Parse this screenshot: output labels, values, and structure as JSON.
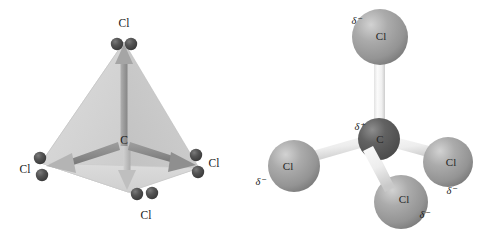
{
  "figure": {
    "background_color": "#ffffff",
    "panels": [
      {
        "id": "tetrahedral-geometry",
        "name": "tetrahedron-bond-dipole-diagram",
        "central_atom": {
          "label": "C",
          "symbol": "C"
        },
        "vertex_labels": [
          {
            "position": "top",
            "label": "Cl"
          },
          {
            "position": "left",
            "label": "Cl"
          },
          {
            "position": "right",
            "label": "Cl"
          },
          {
            "position": "bottom",
            "label": "Cl"
          }
        ],
        "colors": {
          "face_light": "#d8d8d8",
          "face_mid": "#cccccc",
          "face_dark": "#bdbdbd",
          "arrow": "#9a9a9a",
          "arrow_dark": "#7f7f7f",
          "atom_sphere": "#4f4f4f",
          "text": "#1a1a1a"
        }
      },
      {
        "id": "ball-and-stick",
        "name": "ball-and-stick-polarity-diagram",
        "central_atom": {
          "label": "C",
          "charge": "δ⁺"
        },
        "outer_atoms": [
          {
            "position": "top",
            "label": "Cl",
            "charge": "δ⁻"
          },
          {
            "position": "left",
            "label": "Cl",
            "charge": "δ⁻"
          },
          {
            "position": "right",
            "label": "Cl",
            "charge": "δ⁻"
          },
          {
            "position": "bottom",
            "label": "Cl",
            "charge": "δ⁻"
          }
        ],
        "colors": {
          "chlorine_sphere": "#a8a8a8",
          "chlorine_highlight": "#cfcfcf",
          "chlorine_shadow": "#7d7d7d",
          "carbon_sphere": "#5a5a5a",
          "carbon_highlight": "#8a8a8a",
          "bond": "#f2f2f2",
          "bond_shadow": "#c8c8c8",
          "text": "#262626"
        }
      }
    ]
  }
}
